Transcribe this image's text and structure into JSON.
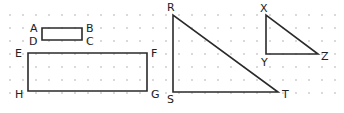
{
  "figure": {
    "type": "geometry-on-dot-grid",
    "grid": {
      "x0": 10,
      "y0": 15,
      "spacing": 13,
      "cols": 26,
      "rows": 7,
      "dot_color": "#c8c8c8"
    },
    "stroke_color": "#2a2a2a",
    "shapes": [
      {
        "id": "rect-ABCD",
        "kind": "rectangle",
        "vertices": [
          {
            "label": "A",
            "x": 42,
            "y": 28,
            "lx": 30,
            "ly": 32
          },
          {
            "label": "B",
            "x": 82,
            "y": 28,
            "lx": 86,
            "ly": 32
          },
          {
            "label": "C",
            "x": 82,
            "y": 40,
            "lx": 86,
            "ly": 45
          },
          {
            "label": "D",
            "x": 42,
            "y": 40,
            "lx": 29,
            "ly": 45
          }
        ]
      },
      {
        "id": "rect-EFGH",
        "kind": "rectangle",
        "vertices": [
          {
            "label": "E",
            "x": 28,
            "y": 53,
            "lx": 15,
            "ly": 57
          },
          {
            "label": "F",
            "x": 147,
            "y": 53,
            "lx": 151,
            "ly": 57
          },
          {
            "label": "G",
            "x": 147,
            "y": 91,
            "lx": 151,
            "ly": 98
          },
          {
            "label": "H",
            "x": 28,
            "y": 91,
            "lx": 15,
            "ly": 98
          }
        ]
      },
      {
        "id": "tri-RST",
        "kind": "triangle",
        "vertices": [
          {
            "label": "R",
            "x": 173,
            "y": 15,
            "lx": 167,
            "ly": 11
          },
          {
            "label": "S",
            "x": 173,
            "y": 92,
            "lx": 167,
            "ly": 103
          },
          {
            "label": "T",
            "x": 278,
            "y": 92,
            "lx": 282,
            "ly": 98
          }
        ]
      },
      {
        "id": "tri-XYZ",
        "kind": "triangle",
        "vertices": [
          {
            "label": "X",
            "x": 266,
            "y": 15,
            "lx": 260,
            "ly": 12
          },
          {
            "label": "Y",
            "x": 266,
            "y": 54,
            "lx": 261,
            "ly": 66
          },
          {
            "label": "Z",
            "x": 318,
            "y": 54,
            "lx": 321,
            "ly": 60
          }
        ]
      }
    ]
  }
}
